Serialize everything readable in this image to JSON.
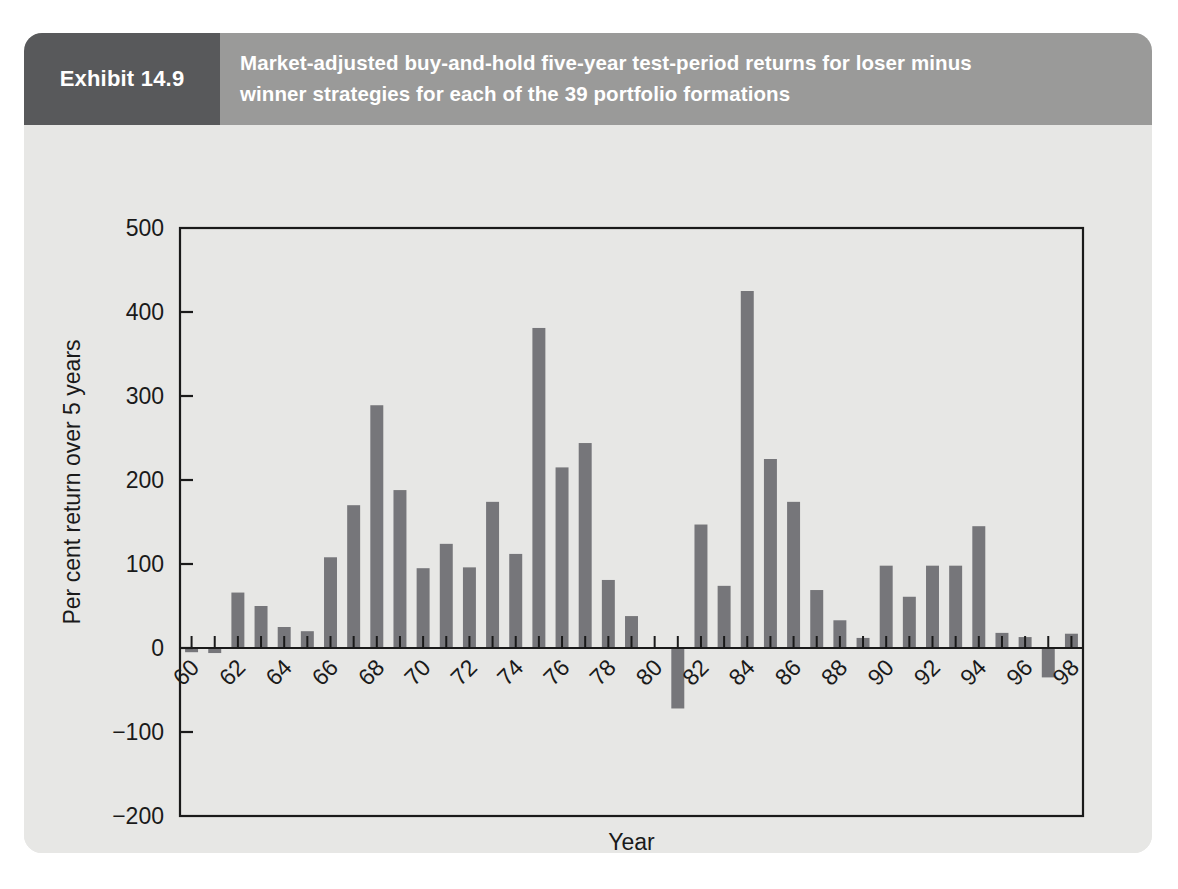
{
  "exhibit": {
    "tag": "Exhibit 14.9",
    "title_line1": "Market-adjusted buy-and-hold five-year test-period returns for loser minus",
    "title_line2": "winner strategies for each of the 39 portfolio formations",
    "tag_bg": "#58595b",
    "header_bg": "#9a9a99",
    "panel_bg": "#e7e7e5"
  },
  "chart_data": {
    "type": "bar",
    "title": "Market-adjusted buy-and-hold five-year test-period returns for loser minus winner strategies for each of the 39 portfolio formations",
    "xlabel": "Year",
    "ylabel": "Per cent return over 5 years",
    "ylim": [
      -200,
      500
    ],
    "ytick_values": [
      500,
      400,
      300,
      200,
      100,
      0,
      -100,
      -200
    ],
    "ytick_labels": [
      "500",
      "400",
      "300",
      "200",
      "100",
      "0",
      "−100",
      "−200"
    ],
    "xtick_labels": [
      "60",
      "62",
      "64",
      "66",
      "68",
      "70",
      "72",
      "74",
      "76",
      "78",
      "80",
      "82",
      "84",
      "86",
      "88",
      "90",
      "92",
      "94",
      "96",
      "98"
    ],
    "xtick_rotation": 45,
    "grid": false,
    "legend": "none",
    "bar_color": "#76767a",
    "categories": [
      "60",
      "61",
      "62",
      "63",
      "64",
      "65",
      "66",
      "67",
      "68",
      "69",
      "70",
      "71",
      "72",
      "73",
      "74",
      "75",
      "76",
      "77",
      "78",
      "79",
      "80",
      "81",
      "82",
      "83",
      "84",
      "85",
      "86",
      "87",
      "88",
      "89",
      "90",
      "91",
      "92",
      "93",
      "94",
      "95",
      "96",
      "97",
      "98"
    ],
    "values": [
      -5,
      -6,
      66,
      50,
      25,
      20,
      108,
      170,
      289,
      188,
      95,
      124,
      96,
      174,
      112,
      381,
      215,
      244,
      81,
      38,
      0,
      -72,
      147,
      74,
      425,
      225,
      174,
      69,
      33,
      12,
      98,
      61,
      98,
      98,
      145,
      18,
      13,
      -35,
      17
    ],
    "n_points": 39
  },
  "axis_titles": {
    "x": "Year",
    "y": "Per cent return over 5 years"
  }
}
